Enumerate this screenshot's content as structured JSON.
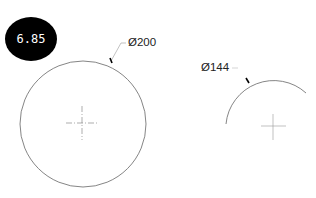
{
  "badge": {
    "value": "6.85"
  },
  "dimensions": [
    {
      "label": "Ø200",
      "x": 128,
      "y": 36
    },
    {
      "label": "Ø144",
      "x": 201,
      "y": 61
    }
  ],
  "colors": {
    "line": "#555555",
    "badge_bg": "#000000",
    "badge_text": "#ffffff"
  }
}
